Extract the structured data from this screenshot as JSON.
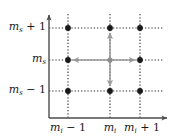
{
  "figure": {
    "kind": "lattice-transition-diagram",
    "width": 174,
    "height": 138,
    "background": "#ffffff"
  },
  "colors": {
    "axis": "#4d4d4d",
    "gridline": "#2b2b2b",
    "node_filled": "#1a1a1a",
    "node_center": "#8c8c8c",
    "arrow": "#9a9a9a",
    "text": "#1a1a1a"
  },
  "axes": {
    "y_axis": {
      "name": "vertical-axis",
      "x": 49,
      "y_top": 14,
      "y_bottom": 118,
      "arrowhead": "up"
    },
    "x_axis": {
      "name": "horizontal-axis",
      "y": 118,
      "x_left": 49,
      "x_right": 168,
      "arrowhead": "right"
    }
  },
  "grid": {
    "columns_x": [
      68,
      110,
      140
    ],
    "rows_y": [
      28,
      60,
      91
    ],
    "column_line_top": 14,
    "column_line_bottom": 118,
    "row_line_left": 49,
    "row_line_right": 163,
    "style": "dotted"
  },
  "y_labels": [
    {
      "base": "m",
      "subscript": "s",
      "operator": "+",
      "operand": "1",
      "text": "m_s + 1",
      "row": 0
    },
    {
      "base": "m",
      "subscript": "s",
      "operator": "",
      "operand": "",
      "text": "m_s",
      "row": 1
    },
    {
      "base": "m",
      "subscript": "s",
      "operator": "−",
      "operand": "1",
      "text": "m_s − 1",
      "row": 2
    }
  ],
  "x_labels": [
    {
      "base": "m",
      "subscript": "i",
      "operator": "−",
      "operand": "1",
      "text": "m_i − 1",
      "col": 0
    },
    {
      "base": "m",
      "subscript": "i",
      "operator": "",
      "operand": "",
      "text": "m_i",
      "col": 1
    },
    {
      "base": "m",
      "subscript": "i",
      "operator": "+",
      "operand": "1",
      "text": "m_i + 1",
      "col": 2
    }
  ],
  "nodes": [
    {
      "id": "n-0-0",
      "col": 0,
      "row": 0,
      "cx": 68,
      "cy": 28,
      "fill": "#1a1a1a",
      "radius": 2.9
    },
    {
      "id": "n-1-0",
      "col": 1,
      "row": 0,
      "cx": 110,
      "cy": 28,
      "fill": "#1a1a1a",
      "radius": 2.9
    },
    {
      "id": "n-2-0",
      "col": 2,
      "row": 0,
      "cx": 140,
      "cy": 28,
      "fill": "#1a1a1a",
      "radius": 2.9
    },
    {
      "id": "n-0-1",
      "col": 0,
      "row": 1,
      "cx": 68,
      "cy": 60,
      "fill": "#1a1a1a",
      "radius": 2.9
    },
    {
      "id": "n-1-1",
      "col": 1,
      "row": 1,
      "cx": 110,
      "cy": 60,
      "fill": "#8c8c8c",
      "radius": 2.6
    },
    {
      "id": "n-2-1",
      "col": 2,
      "row": 1,
      "cx": 140,
      "cy": 60,
      "fill": "#1a1a1a",
      "radius": 2.9
    },
    {
      "id": "n-0-2",
      "col": 0,
      "row": 2,
      "cx": 68,
      "cy": 91,
      "fill": "#1a1a1a",
      "radius": 2.9
    },
    {
      "id": "n-1-2",
      "col": 1,
      "row": 2,
      "cx": 110,
      "cy": 91,
      "fill": "#1a1a1a",
      "radius": 2.9
    },
    {
      "id": "n-2-2",
      "col": 2,
      "row": 2,
      "cx": 140,
      "cy": 91,
      "fill": "#1a1a1a",
      "radius": 2.9
    }
  ],
  "transition_arrows": [
    {
      "id": "arrow-up",
      "direction": "up",
      "from": [
        110,
        60
      ],
      "to": [
        110,
        31
      ]
    },
    {
      "id": "arrow-down",
      "direction": "down",
      "from": [
        110,
        60
      ],
      "to": [
        110,
        88
      ]
    },
    {
      "id": "arrow-left",
      "direction": "left",
      "from": [
        110,
        60
      ],
      "to": [
        71,
        60
      ]
    },
    {
      "id": "arrow-right",
      "direction": "right",
      "from": [
        110,
        60
      ],
      "to": [
        137,
        60
      ]
    }
  ]
}
